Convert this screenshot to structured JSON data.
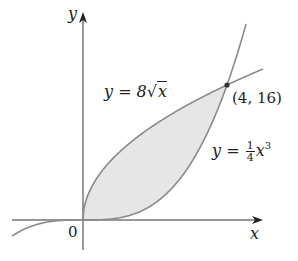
{
  "figure": {
    "axes": {
      "x_label": "x",
      "y_label": "y",
      "origin_label": "0"
    },
    "curves": [
      {
        "name": "sqrt-curve",
        "label_lhs": "y = 8",
        "label_radicand": "x",
        "equation": "y = 8√x"
      },
      {
        "name": "cubic-curve",
        "label_lhs": "y = ",
        "label_num": "1",
        "label_den": "4",
        "label_var": "x",
        "label_exp": "3",
        "equation": "y = (1/4)x^3"
      }
    ],
    "intersection": {
      "label": "(4, 16)",
      "x": 4,
      "y": 16
    },
    "shaded_region": {
      "between": [
        "y = 8√x",
        "y = (1/4)x^3"
      ],
      "x_from": 0,
      "x_to": 4
    },
    "colors": {
      "curve": "#8a8a8a",
      "axis": "#333333",
      "shade": "#e6e6e6",
      "point": "#333333"
    }
  }
}
